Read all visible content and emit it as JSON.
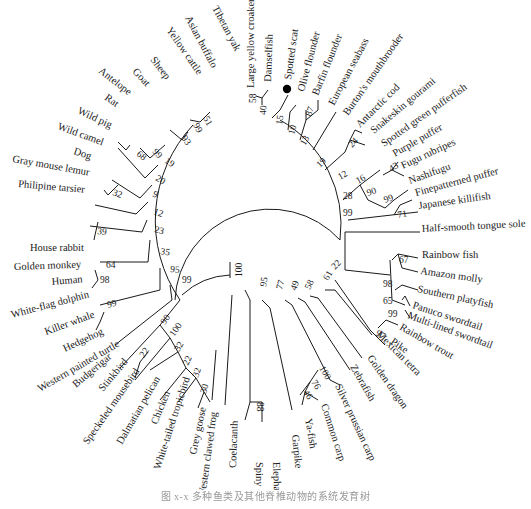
{
  "figure": {
    "type": "circular phylogenetic tree",
    "highlighted_taxon": "Spotted scat",
    "highlight_marker": "filled-circle",
    "line_color": "#1a1a1a",
    "caption": "图 x-x 多种鱼类及其他脊椎动物的系统发育树"
  },
  "taxa": [
    {
      "id": "t1",
      "label": "Tibetan yak",
      "x": 212,
      "y": 8,
      "angle": 62
    },
    {
      "id": "t2",
      "label": "Asian buffalo",
      "x": 185,
      "y": 18,
      "angle": 62
    },
    {
      "id": "t3",
      "label": "Yellow cattle",
      "x": 166,
      "y": 30,
      "angle": 55
    },
    {
      "id": "t4",
      "label": "Sheep",
      "x": 150,
      "y": 60,
      "angle": 52
    },
    {
      "id": "t5",
      "label": "Goat",
      "x": 132,
      "y": 72,
      "angle": 47
    },
    {
      "id": "t6",
      "label": "Antelope",
      "x": 98,
      "y": 72,
      "angle": 38
    },
    {
      "id": "t7",
      "label": "Rat",
      "x": 104,
      "y": 99,
      "angle": 35
    },
    {
      "id": "t8",
      "label": "Wild pig",
      "x": 77,
      "y": 113,
      "angle": 25
    },
    {
      "id": "t9",
      "label": "Wild camel",
      "x": 57,
      "y": 129,
      "angle": 20
    },
    {
      "id": "t10",
      "label": "Dog",
      "x": 73,
      "y": 154,
      "angle": 18
    },
    {
      "id": "t11",
      "label": "Gray mouse lemur",
      "x": 12,
      "y": 162,
      "angle": 10
    },
    {
      "id": "t12",
      "label": "Philipine tarsier",
      "x": 18,
      "y": 187,
      "angle": 5
    },
    {
      "id": "t13",
      "label": "House rabbit",
      "x": 30,
      "y": 251,
      "angle": 0
    },
    {
      "id": "t14",
      "label": "Golden monkey",
      "x": 14,
      "y": 270,
      "angle": -2
    },
    {
      "id": "t15",
      "label": "Human",
      "x": 52,
      "y": 285,
      "angle": -5
    },
    {
      "id": "t16",
      "label": "White-flag dolphin",
      "x": 12,
      "y": 318,
      "angle": -15
    },
    {
      "id": "t17",
      "label": "Killer whale",
      "x": 46,
      "y": 335,
      "angle": -20
    },
    {
      "id": "t18",
      "label": "Hedgehog",
      "x": 65,
      "y": 352,
      "angle": -25
    },
    {
      "id": "t19",
      "label": "Western painted turtle",
      "x": 40,
      "y": 392,
      "angle": -30
    },
    {
      "id": "t20",
      "label": "Budgerigar",
      "x": 76,
      "y": 388,
      "angle": -40
    },
    {
      "id": "t21",
      "label": "Stinkbird",
      "x": 103,
      "y": 392,
      "angle": -50
    },
    {
      "id": "t22",
      "label": "Speckeled mousebird",
      "x": 88,
      "y": 445,
      "angle": -55
    },
    {
      "id": "t23",
      "label": "Dalmatian pelican",
      "x": 122,
      "y": 445,
      "angle": -60
    },
    {
      "id": "t24",
      "label": "Chicken",
      "x": 157,
      "y": 425,
      "angle": -68
    },
    {
      "id": "t25",
      "label": "White-tailed tropicbird",
      "x": 160,
      "y": 470,
      "angle": -72
    },
    {
      "id": "t26",
      "label": "Grey goose",
      "x": 196,
      "y": 455,
      "angle": -78
    },
    {
      "id": "t27",
      "label": "Western clawed frog",
      "x": 205,
      "y": 498,
      "angle": -82
    },
    {
      "id": "t28",
      "label": "Coelacanth",
      "x": 236,
      "y": 468,
      "angle": -88
    },
    {
      "id": "t29",
      "label": "Spiny dogfish",
      "x": 256,
      "y": 462,
      "angle": 90
    },
    {
      "id": "t30",
      "label": "Elephant shark",
      "x": 273,
      "y": 462,
      "angle": 88
    },
    {
      "id": "t31",
      "label": "Garpike",
      "x": 292,
      "y": 435,
      "angle": 84
    },
    {
      "id": "t32",
      "label": "Ya-fish",
      "x": 305,
      "y": 419,
      "angle": 80
    },
    {
      "id": "t33",
      "label": "Common carp",
      "x": 321,
      "y": 405,
      "angle": 72
    },
    {
      "id": "t34",
      "label": "Silver prussian carp",
      "x": 335,
      "y": 386,
      "angle": 65
    },
    {
      "id": "t35",
      "label": "Zebrafish",
      "x": 350,
      "y": 367,
      "angle": 60
    },
    {
      "id": "t36",
      "label": "Golden dragon",
      "x": 367,
      "y": 358,
      "angle": 55
    },
    {
      "id": "t37",
      "label": "Mexican tetra",
      "x": 376,
      "y": 335,
      "angle": 45
    },
    {
      "id": "t38",
      "label": "Pike",
      "x": 390,
      "y": 343,
      "angle": 35
    },
    {
      "id": "t39",
      "label": "Rainbow trout",
      "x": 399,
      "y": 329,
      "angle": 30
    },
    {
      "id": "t40",
      "label": "Multi-lined swordtail",
      "x": 407,
      "y": 318,
      "angle": 20
    },
    {
      "id": "t41",
      "label": "Panuco swordtail",
      "x": 412,
      "y": 308,
      "angle": 18
    },
    {
      "id": "t42",
      "label": "Southern platyfish",
      "x": 417,
      "y": 292,
      "angle": 12
    },
    {
      "id": "t43",
      "label": "Amazon molly",
      "x": 420,
      "y": 274,
      "angle": 8
    },
    {
      "id": "t44",
      "label": "Rainbow fish",
      "x": 422,
      "y": 258,
      "angle": 0
    },
    {
      "id": "t45",
      "label": "Half-smooth tongue sole",
      "x": 422,
      "y": 232,
      "angle": -3
    },
    {
      "id": "t46",
      "label": "Japanese killifish",
      "x": 419,
      "y": 209,
      "angle": -8
    },
    {
      "id": "t47",
      "label": "Finepatterned puffer",
      "x": 416,
      "y": 196,
      "angle": -15
    },
    {
      "id": "t48",
      "label": "Nashifugu",
      "x": 410,
      "y": 184,
      "angle": -20
    },
    {
      "id": "t49",
      "label": "Fugu rubripes",
      "x": 403,
      "y": 169,
      "angle": -25
    },
    {
      "id": "t50",
      "label": "Purple puffer",
      "x": 395,
      "y": 157,
      "angle": -30
    },
    {
      "id": "t51",
      "label": "Spotted green pufferfish",
      "x": 384,
      "y": 147,
      "angle": -35
    },
    {
      "id": "t52",
      "label": "Snakeskin gourami",
      "x": 374,
      "y": 134,
      "angle": -40
    },
    {
      "id": "t53",
      "label": "Antarctic cod",
      "x": 360,
      "y": 128,
      "angle": -45
    },
    {
      "id": "t54",
      "label": "Burton's mouthbrooder",
      "x": 348,
      "y": 116,
      "angle": -55
    },
    {
      "id": "t55",
      "label": "European seabass",
      "x": 334,
      "y": 106,
      "angle": -62
    },
    {
      "id": "t56",
      "label": "Barfin flounder",
      "x": 318,
      "y": 96,
      "angle": -68
    },
    {
      "id": "t57",
      "label": "Olive flounder",
      "x": 304,
      "y": 92,
      "angle": -75
    },
    {
      "id": "t58",
      "label": "Spotted scat",
      "x": 291,
      "y": 80,
      "angle": -82
    },
    {
      "id": "t59",
      "label": "Damselfish",
      "x": 271,
      "y": 82,
      "angle": -88
    },
    {
      "id": "t60",
      "label": "Large yellow croaker",
      "x": 254,
      "y": 88,
      "angle": -90
    }
  ],
  "bootstrap": [
    {
      "value": "51",
      "x": 203,
      "y": 118,
      "angle": 62
    },
    {
      "value": "99",
      "x": 193,
      "y": 125,
      "angle": 62
    },
    {
      "value": "93",
      "x": 181,
      "y": 138,
      "angle": 55
    },
    {
      "value": "99",
      "x": 152,
      "y": 152,
      "angle": 47
    },
    {
      "value": "68",
      "x": 136,
      "y": 155,
      "angle": 38
    },
    {
      "value": "19",
      "x": 164,
      "y": 162,
      "angle": 35
    },
    {
      "value": "20",
      "x": 155,
      "y": 180,
      "angle": 30
    },
    {
      "value": "32",
      "x": 112,
      "y": 195,
      "angle": 20
    },
    {
      "value": "9",
      "x": 152,
      "y": 196,
      "angle": 25
    },
    {
      "value": "12",
      "x": 153,
      "y": 214,
      "angle": 20
    },
    {
      "value": "39",
      "x": 97,
      "y": 234,
      "angle": 5
    },
    {
      "value": "23",
      "x": 154,
      "y": 232,
      "angle": 15
    },
    {
      "value": "35",
      "x": 160,
      "y": 254,
      "angle": 10
    },
    {
      "value": "64",
      "x": 106,
      "y": 268,
      "angle": 0
    },
    {
      "value": "98",
      "x": 100,
      "y": 283,
      "angle": 0
    },
    {
      "value": "95",
      "x": 170,
      "y": 272,
      "angle": 5
    },
    {
      "value": "99",
      "x": 182,
      "y": 283,
      "angle": 0
    },
    {
      "value": "99",
      "x": 108,
      "y": 308,
      "angle": -15
    },
    {
      "value": "90",
      "x": 165,
      "y": 325,
      "angle": -55
    },
    {
      "value": "100",
      "x": 174,
      "y": 337,
      "angle": -55
    },
    {
      "value": "22",
      "x": 144,
      "y": 358,
      "angle": -55
    },
    {
      "value": "32",
      "x": 179,
      "y": 352,
      "angle": -60
    },
    {
      "value": "22",
      "x": 188,
      "y": 366,
      "angle": -65
    },
    {
      "value": "32",
      "x": 198,
      "y": 378,
      "angle": -70
    },
    {
      "value": "30",
      "x": 206,
      "y": 394,
      "angle": -75
    },
    {
      "value": "100",
      "x": 242,
      "y": 277,
      "angle": -90
    },
    {
      "value": "95",
      "x": 266,
      "y": 287,
      "angle": -80
    },
    {
      "value": "77",
      "x": 282,
      "y": 290,
      "angle": -75
    },
    {
      "value": "49",
      "x": 296,
      "y": 291,
      "angle": -70
    },
    {
      "value": "58",
      "x": 310,
      "y": 290,
      "angle": -65
    },
    {
      "value": "61",
      "x": 328,
      "y": 281,
      "angle": -60
    },
    {
      "value": "22",
      "x": 335,
      "y": 270,
      "angle": -45
    },
    {
      "value": "97",
      "x": 375,
      "y": 335,
      "angle": 30
    },
    {
      "value": "67",
      "x": 399,
      "y": 263,
      "angle": 0
    },
    {
      "value": "98",
      "x": 383,
      "y": 287,
      "angle": 0
    },
    {
      "value": "65",
      "x": 383,
      "y": 304,
      "angle": 0
    },
    {
      "value": "99",
      "x": 388,
      "y": 317,
      "angle": 0
    },
    {
      "value": "88",
      "x": 257,
      "y": 402,
      "angle": 90
    },
    {
      "value": "100",
      "x": 319,
      "y": 368,
      "angle": 60
    },
    {
      "value": "76",
      "x": 311,
      "y": 382,
      "angle": 60
    },
    {
      "value": "46",
      "x": 303,
      "y": 392,
      "angle": 60
    },
    {
      "value": "99",
      "x": 343,
      "y": 216,
      "angle": 0
    },
    {
      "value": "28",
      "x": 343,
      "y": 199,
      "angle": 0
    },
    {
      "value": "12",
      "x": 340,
      "y": 180,
      "angle": -30
    },
    {
      "value": "19",
      "x": 320,
      "y": 168,
      "angle": -45
    },
    {
      "value": "13",
      "x": 305,
      "y": 146,
      "angle": -60
    },
    {
      "value": "10",
      "x": 294,
      "y": 135,
      "angle": -75
    },
    {
      "value": "15",
      "x": 282,
      "y": 125,
      "angle": -82
    },
    {
      "value": "40",
      "x": 266,
      "y": 115,
      "angle": -88
    },
    {
      "value": "58",
      "x": 256,
      "y": 103,
      "angle": -90
    },
    {
      "value": "87",
      "x": 311,
      "y": 117,
      "angle": -70
    },
    {
      "value": "24",
      "x": 352,
      "y": 148,
      "angle": -45
    },
    {
      "value": "16",
      "x": 358,
      "y": 184,
      "angle": -30
    },
    {
      "value": "43",
      "x": 391,
      "y": 172,
      "angle": -30
    },
    {
      "value": "90",
      "x": 368,
      "y": 196,
      "angle": -20
    },
    {
      "value": "99",
      "x": 385,
      "y": 203,
      "angle": -20
    },
    {
      "value": "71",
      "x": 398,
      "y": 218,
      "angle": -10
    }
  ]
}
